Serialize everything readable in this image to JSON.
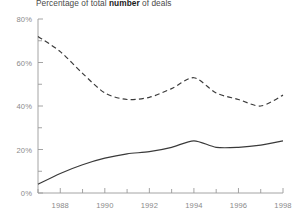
{
  "chart_data": {
    "type": "line",
    "title_prefix": "Percentage of total ",
    "title_bold": "number",
    "title_suffix": " of deals",
    "title": "Percentage of total number of deals",
    "xlabel": "",
    "ylabel": "",
    "xlim": [
      1987,
      1998
    ],
    "ylim": [
      0,
      80
    ],
    "grid": false,
    "legend": "none",
    "x_tick_labels": [
      "1988",
      "1990",
      "1992",
      "1994",
      "1996",
      "1998"
    ],
    "x_tick_values": [
      1988,
      1990,
      1992,
      1994,
      1996,
      1998
    ],
    "x_minor_ticks": [
      1987,
      1989,
      1991,
      1993,
      1995,
      1997
    ],
    "y_tick_labels": [
      "0%",
      "20%",
      "40%",
      "60%",
      "80%"
    ],
    "y_tick_values": [
      0,
      20,
      40,
      60,
      80
    ],
    "y_minor_ticks": [
      10,
      30,
      50,
      70
    ],
    "x": [
      1987,
      1988,
      1989,
      1990,
      1991,
      1992,
      1993,
      1994,
      1995,
      1996,
      1997,
      1998
    ],
    "series": [
      {
        "name": "dashed-series",
        "style": "dashed",
        "color": "#3a3a3a",
        "values": [
          72,
          65,
          55,
          46,
          43,
          44,
          48,
          53,
          46,
          43,
          40,
          45
        ]
      },
      {
        "name": "solid-series",
        "style": "solid",
        "color": "#3a3a3a",
        "values": [
          4,
          9,
          13,
          16,
          18,
          19,
          21,
          24,
          21,
          21,
          22,
          24
        ]
      }
    ]
  },
  "axis_colors": {
    "axis_line": "#9a9a9a",
    "tick": "#9a9a9a",
    "label": "#8a8a8a",
    "title": "#4a4a4a"
  }
}
